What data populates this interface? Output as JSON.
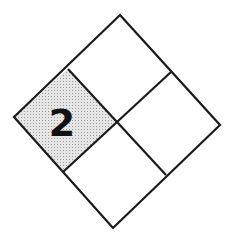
{
  "diagram": {
    "type": "nfpa-704-hazard-diamond",
    "quadrants": {
      "top": {
        "value": ""
      },
      "left": {
        "value": "2",
        "shaded": true
      },
      "right": {
        "value": ""
      },
      "bottom": {
        "value": ""
      }
    },
    "colors": {
      "stroke": "#1a1a1a",
      "shade": "#d9d9d9",
      "background": "#ffffff"
    }
  }
}
